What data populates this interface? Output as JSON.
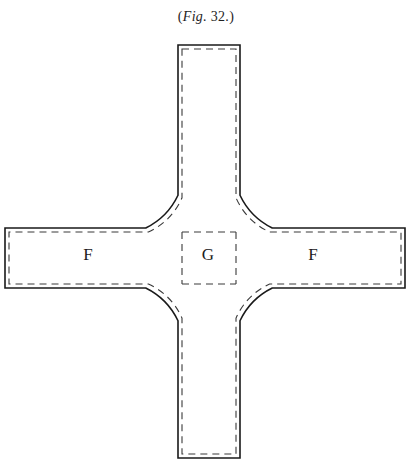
{
  "figure": {
    "caption_prefix": "(",
    "caption_italic": "Fig.",
    "caption_number": " 32.",
    "caption_suffix": ")",
    "caption_full": "(Fig. 32.)",
    "colors": {
      "background": "#ffffff",
      "outline": "#1a1a1a",
      "dashed": "#3a3a3a",
      "label": "#1c1c1c"
    },
    "line": {
      "outline_width": 1.6,
      "dash_width": 1.1,
      "dash_pattern": "7 5"
    },
    "labels": [
      {
        "text": "F",
        "x": 88,
        "y": 256,
        "name": "label-f-left"
      },
      {
        "text": "G",
        "x": 208,
        "y": 256,
        "name": "label-g-center"
      },
      {
        "text": "F",
        "x": 313,
        "y": 256,
        "name": "label-f-right"
      }
    ],
    "geometry": {
      "center_x": 209,
      "center_y": 258,
      "hub_radius": 70,
      "vertical_arm": {
        "left": 178,
        "right": 240,
        "top": 45,
        "bottom": 458
      },
      "horizontal_arm": {
        "left": 5,
        "right": 405,
        "top": 228,
        "bottom": 288
      },
      "inset": 4
    }
  }
}
